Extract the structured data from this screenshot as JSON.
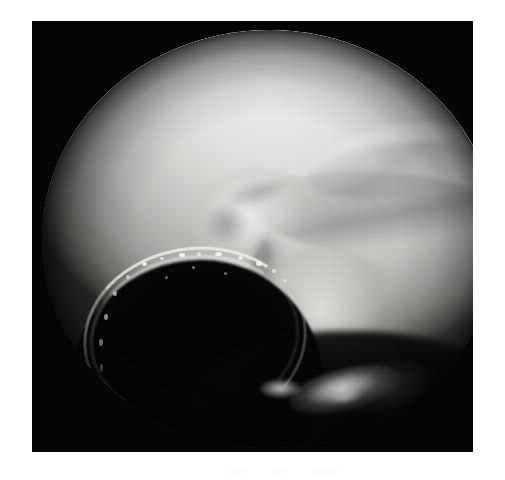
{
  "page": {
    "kind": "photograph",
    "background_color": "#ffffff",
    "width": 505,
    "height": 480
  },
  "photo": {
    "title": "",
    "caption": "",
    "modality": "arthroscopy",
    "subject": "knee joint cartilage surface",
    "color_mode": "grayscale",
    "frame": {
      "border_color": "#030303",
      "left": 32,
      "top": 21,
      "width": 441,
      "height": 431
    },
    "field_of_view": {
      "shape": "circular",
      "label": "endoscopic circular field of view",
      "center_x": 238,
      "center_y": 218,
      "radius_x": 228,
      "radius_y": 209
    },
    "palette": {
      "frame_black": "#030303",
      "page_white": "#ffffff",
      "tissue_highlight": "#eeeeec",
      "tissue_midtone": "#bdbdb9",
      "tissue_shadow": "#6e6e6a",
      "void_black": "#020202",
      "specular_white": "#fffffc"
    },
    "regions": [
      {
        "name": "condyle-upper",
        "label": "Upper femoral condyle cartilage dome",
        "tone": "bright"
      },
      {
        "name": "condyle-right",
        "label": "Lateral condylar ridge",
        "tone": "bright"
      },
      {
        "name": "sulcus-groove",
        "label": "Diagonal sulcus / cartilage crease",
        "tone": "shadow"
      },
      {
        "name": "lesion-central",
        "label": "Central fibrillated cartilage lesion",
        "tone": "mottled"
      },
      {
        "name": "tissue-lobe-lower",
        "label": "Lower soft tissue lobe",
        "tone": "midtone"
      },
      {
        "name": "dark-void",
        "label": "Intercondylar shadow cavity",
        "tone": "black"
      },
      {
        "name": "void-rim-arc",
        "label": "Illuminated cavity rim",
        "tone": "specular"
      },
      {
        "name": "specular-cluster",
        "label": "Specular light reflections on wet tissue",
        "tone": "specular"
      },
      {
        "name": "tissue-fragment-lr",
        "label": "Dim tissue fragment, lower right",
        "tone": "dark-midtone"
      }
    ]
  }
}
